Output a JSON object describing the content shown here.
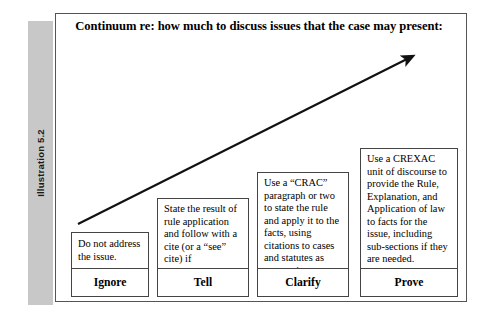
{
  "illustration": {
    "label": "Illustration 5.2"
  },
  "diagram": {
    "title": "Continuum re: how much to discuss issues that the case may present:",
    "arrow": {
      "name": "upward-trend-arrow",
      "color": "#111111",
      "from": [
        23,
        211
      ],
      "to": [
        364,
        39
      ]
    },
    "boxes": [
      {
        "id": "ignore",
        "text": "Do not address the issue.",
        "label": "Ignore"
      },
      {
        "id": "tell",
        "text": "State the result of rule application and follow with a cite (or a “see” cite) if appropriate.",
        "label": "Tell"
      },
      {
        "id": "clarify",
        "text": "Use a “CRAC” paragraph or two to state the rule and apply it to the facts, using citations to cases and statutes as appropriate.",
        "label": "Clarify"
      },
      {
        "id": "prove",
        "text": "Use a CREXAC unit of discourse to provide the Rule, Explanation, and Application of law to facts for the issue, including sub-sections if they are needed.",
        "label": "Prove"
      }
    ]
  },
  "colors": {
    "band": "#c8c8c8",
    "frame_border": "#555555",
    "box_border": "#444444",
    "text": "#000000"
  }
}
